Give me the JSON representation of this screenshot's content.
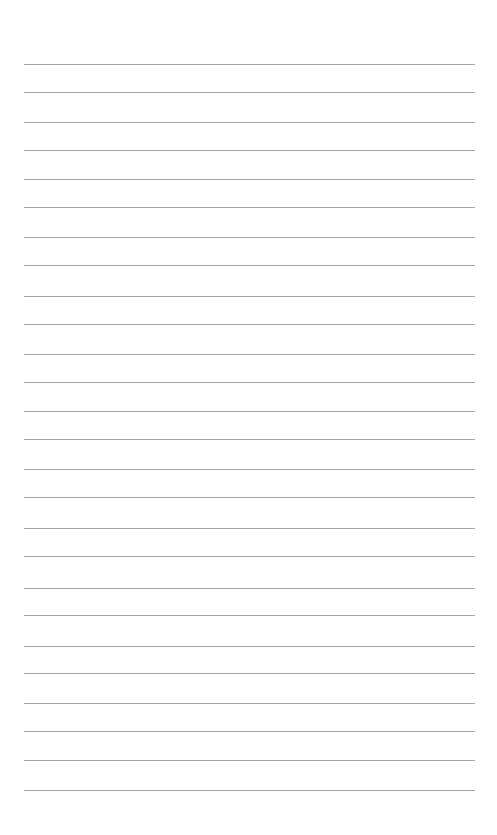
{
  "page": {
    "type": "lined-paper",
    "background_color": "#ffffff",
    "line_color": "#9a9a9a",
    "line_count": 26,
    "line_left": 24,
    "line_right": 475,
    "line_positions_y": [
      64,
      92,
      122,
      150,
      179,
      207,
      237,
      265,
      296,
      324,
      354,
      382,
      411,
      439,
      469,
      497,
      528,
      556,
      588,
      615,
      646,
      673,
      703,
      731,
      760,
      790
    ]
  }
}
